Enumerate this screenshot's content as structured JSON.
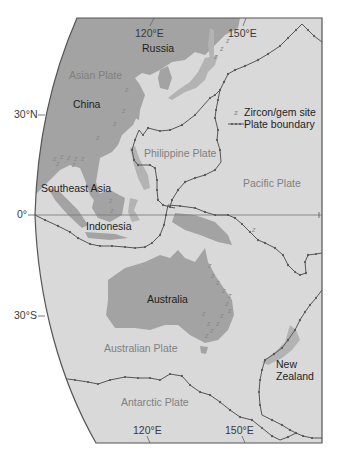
{
  "map": {
    "colors": {
      "ocean": "#d9d9d9",
      "land": "#a3a3a3",
      "boundary": "#555555",
      "frame": "#555555",
      "plate_label": "#808080",
      "text": "#1e1e1e"
    },
    "longitude_labels": {
      "top_120": "120°E",
      "top_150": "150°E",
      "bottom_120": "120°E",
      "bottom_150": "150°E"
    },
    "latitude_labels": {
      "n30": "30°N",
      "eq": "0°",
      "s30": "30°S"
    },
    "regions": {
      "russia": "Russia",
      "china": "China",
      "southeast_asia": "Southeast Asia",
      "indonesia": "Indonesia",
      "australia": "Australia",
      "new_zealand_line1": "New",
      "new_zealand_line2": "Zealand"
    },
    "plates": {
      "asian": "Asian Plate",
      "philippine": "Philippine Plate",
      "pacific": "Pacific Plate",
      "australian": "Australian Plate",
      "antarctic": "Antarctic Plate"
    },
    "legend": {
      "zircon_symbol": "z",
      "zircon_label": "Zircon/gem site",
      "boundary_label": "Plate boundary"
    },
    "zircon_marker": "z"
  }
}
